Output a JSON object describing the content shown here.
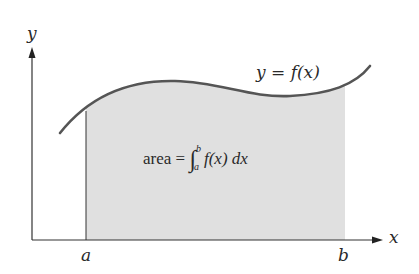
{
  "diagram": {
    "axes": {
      "x_label": "x",
      "y_label": "y"
    },
    "curve": {
      "label_lhs": "y",
      "label_eq": "=",
      "label_rhs": "f(x)",
      "stroke_color": "#555555"
    },
    "bounds": {
      "a_label": "a",
      "b_label": "b"
    },
    "area_formula": {
      "word": "area",
      "equals": "=",
      "integral_symbol": "∫",
      "lower_limit": "a",
      "upper_limit": "b",
      "integrand": "f(x)",
      "differential": "dx"
    },
    "colors": {
      "shade_fill": "#e0e0e0",
      "axis_color": "#333333",
      "background": "#ffffff"
    }
  }
}
